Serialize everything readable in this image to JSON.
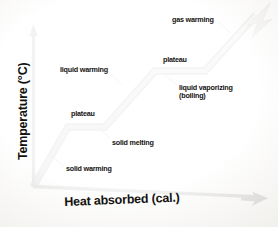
{
  "diagram": {
    "background_color": "#fbfaf8",
    "axes": {
      "y_label": "Temperature (°C)",
      "x_label": "Heat absorbed (cal.)",
      "axis_color": "#0d0c0a",
      "origin": [
        33,
        187
      ]
    },
    "curve": {
      "stroke_color": "#8d8d8a",
      "outline_color": "#2a2a28",
      "arrow_color": "#7e7e7c",
      "vertices": [
        [
          33,
          187
        ],
        [
          68,
          127
        ],
        [
          105,
          127
        ],
        [
          155,
          71
        ],
        [
          205,
          71
        ],
        [
          258,
          13
        ]
      ]
    },
    "annotations": [
      {
        "name": "solid-warming",
        "text": "solid warming",
        "segment": "solid heating"
      },
      {
        "name": "plateau-1",
        "text": "plateau",
        "segment": "melting plateau"
      },
      {
        "name": "solid-melting",
        "text": "solid melting",
        "segment": "melting plateau"
      },
      {
        "name": "liquid-warming",
        "text": "liquid warming",
        "segment": "liquid heating"
      },
      {
        "name": "plateau-2",
        "text": "plateau",
        "segment": "boiling plateau"
      },
      {
        "name": "liquid-vaporizing",
        "text": "liquid vaporizing\n(boiling)",
        "segment": "boiling plateau"
      },
      {
        "name": "gas-warming",
        "text": "gas warming",
        "segment": "gas heating"
      }
    ],
    "annotation_text": {
      "solid_warming": "solid warming",
      "plateau_1": "plateau",
      "solid_melting": "solid melting",
      "liquid_warming": "liquid warming",
      "plateau_2": "plateau",
      "liquid_vaporizing_line1": "liquid vaporizing",
      "liquid_vaporizing_line2": "(boiling)",
      "gas_warming": "gas warming"
    }
  }
}
